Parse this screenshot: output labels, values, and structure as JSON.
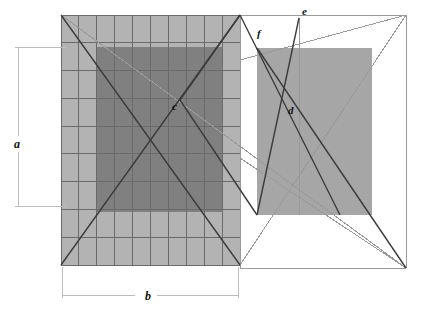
{
  "figure": {
    "background_color": "#ffffff",
    "width": 422,
    "height": 318
  },
  "colors": {
    "light_gray_fill": "#b3b3b3",
    "dark_gray_fill": "#808080",
    "right_rect_fill": "#a6a6a6",
    "grid_line": "#6b6b6b",
    "heavy_line": "#3c3c3c",
    "thin_line": "#9a9a9a",
    "dimension_line": "#bdbdbd",
    "label_color": "#111111"
  },
  "shapes": {
    "grid_rect": {
      "name": "gridded-light-rectangle",
      "x": 61,
      "y": 15,
      "width": 179,
      "height": 250,
      "columns": 10,
      "rows": 9,
      "fill": "#b3b3b3"
    },
    "inner_dark_rect": {
      "name": "inner-dark-rectangle",
      "x": 97,
      "y": 47,
      "width": 125,
      "height": 165,
      "fill": "#808080"
    },
    "right_rect": {
      "name": "right-similar-rectangle",
      "x": 257,
      "y": 48,
      "width": 115,
      "height": 167,
      "fill": "#a6a6a6"
    },
    "outer_frame": {
      "name": "outer-frame-rectangle",
      "x": 240,
      "y": 15,
      "width": 166,
      "height": 253
    }
  },
  "points": [
    {
      "id": "c",
      "label": "c",
      "x": 180,
      "y": 100,
      "label_x": 172,
      "label_y": 110,
      "description": "center of pencil of lines in gridded rectangle"
    },
    {
      "id": "d",
      "label": "d",
      "x": 295,
      "y": 100,
      "label_x": 288,
      "label_y": 114,
      "description": "intersection point in right rectangle"
    },
    {
      "id": "e",
      "label": "e",
      "x": 299,
      "y": 18,
      "label_x": 302,
      "label_y": 15,
      "description": "apex point on top frame edge"
    },
    {
      "id": "f",
      "label": "f",
      "x": 253,
      "y": 40,
      "label_x": 257,
      "label_y": 37,
      "description": "intersection of diagonals above right rectangle"
    }
  ],
  "dimensions": [
    {
      "id": "a",
      "label": "a",
      "orientation": "vertical",
      "axis_x": 18,
      "from_y": 47,
      "to_y": 206,
      "tick_extent_x": 66,
      "label_x": 14,
      "label_y": 148,
      "description": "height of inner dark rectangle"
    },
    {
      "id": "b",
      "label": "b",
      "orientation": "horizontal",
      "axis_y": 295,
      "from_x": 62,
      "to_x": 238,
      "tick_extent_y": 267,
      "label_x": 145,
      "label_y": 300,
      "description": "width of gridded rectangle"
    }
  ],
  "lines": {
    "heavy": [
      {
        "name": "diagonal-grid-tl-to-br",
        "x1": 61,
        "y1": 15,
        "x2": 240,
        "y2": 265
      },
      {
        "name": "diagonal-grid-bl-to-tr",
        "x1": 61,
        "y1": 265,
        "x2": 240,
        "y2": 15
      },
      {
        "name": "ray-c-to-grid-topright",
        "x1": 180,
        "y1": 100,
        "x2": 240,
        "y2": 15
      },
      {
        "name": "ray-c-to-right-rect-bottomleft",
        "x1": 180,
        "y1": 100,
        "x2": 257,
        "y2": 215
      },
      {
        "name": "ray-f-to-right-rect-bottom",
        "x1": 240,
        "y1": 15,
        "x2": 340,
        "y2": 215
      },
      {
        "name": "ray-right-rect-topleft-to-frame-br",
        "x1": 257,
        "y1": 48,
        "x2": 406,
        "y2": 268
      },
      {
        "name": "ray-right-rect-bottomleft-to-e",
        "x1": 257,
        "y1": 215,
        "x2": 299,
        "y2": 18
      }
    ],
    "thin": [
      {
        "name": "frame-top-edge",
        "x1": 240,
        "y1": 15,
        "x2": 406,
        "y2": 15
      },
      {
        "name": "frame-right-edge",
        "x1": 406,
        "y1": 15,
        "x2": 406,
        "y2": 268
      },
      {
        "name": "frame-bottom-edge",
        "x1": 240,
        "y1": 268,
        "x2": 406,
        "y2": 268
      },
      {
        "name": "frame-left-edge",
        "x1": 240,
        "y1": 15,
        "x2": 240,
        "y2": 268
      },
      {
        "name": "frame-diagonal-tr-to-bl",
        "x1": 406,
        "y1": 15,
        "x2": 240,
        "y2": 265
      },
      {
        "name": "vertical-through-e",
        "x1": 299,
        "y1": 18,
        "x2": 299,
        "y2": 215
      },
      {
        "name": "line-f-to-e-extended",
        "x1": 240,
        "y1": 60,
        "x2": 406,
        "y2": 15
      },
      {
        "name": "long-diagonal-c-to-frame-br",
        "x1": 61,
        "y1": 15,
        "x2": 406,
        "y2": 268
      },
      {
        "name": "grid-right-to-frame-br",
        "x1": 240,
        "y1": 158,
        "x2": 406,
        "y2": 268
      }
    ]
  },
  "semantics": {
    "description": "Technical geometry figure illustrating rectangle subdivision and projection",
    "point_labels": [
      "c",
      "d",
      "e",
      "f"
    ],
    "dimension_labels": [
      "a",
      "b"
    ]
  }
}
